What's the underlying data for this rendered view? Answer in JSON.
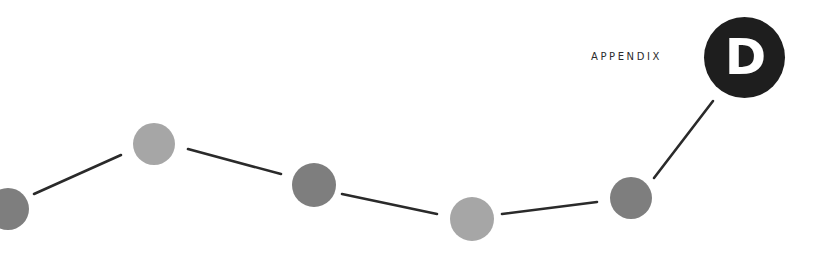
{
  "header": {
    "label": "APPENDIX",
    "badge_letter": "D",
    "badge_color": "#1e1e1e",
    "badge_text_color": "#ffffff"
  },
  "decoration": {
    "line_color": "#2a2a2a",
    "points": [
      {
        "x": 8,
        "y": 209,
        "r": 21,
        "color": "#7e7e7e"
      },
      {
        "x": 154,
        "y": 144,
        "r": 21,
        "color": "#a6a6a6"
      },
      {
        "x": 314,
        "y": 185,
        "r": 22,
        "color": "#7e7e7e"
      },
      {
        "x": 472,
        "y": 219,
        "r": 22,
        "color": "#a6a6a6"
      },
      {
        "x": 631,
        "y": 198,
        "r": 21,
        "color": "#7e7e7e"
      }
    ],
    "segments": [
      {
        "x1": 34,
        "y1": 194,
        "x2": 121,
        "y2": 155
      },
      {
        "x1": 188,
        "y1": 149,
        "x2": 281,
        "y2": 174
      },
      {
        "x1": 342,
        "y1": 194,
        "x2": 437,
        "y2": 214
      },
      {
        "x1": 502,
        "y1": 214,
        "x2": 597,
        "y2": 202
      },
      {
        "x1": 654,
        "y1": 178,
        "x2": 713,
        "y2": 101
      }
    ]
  }
}
